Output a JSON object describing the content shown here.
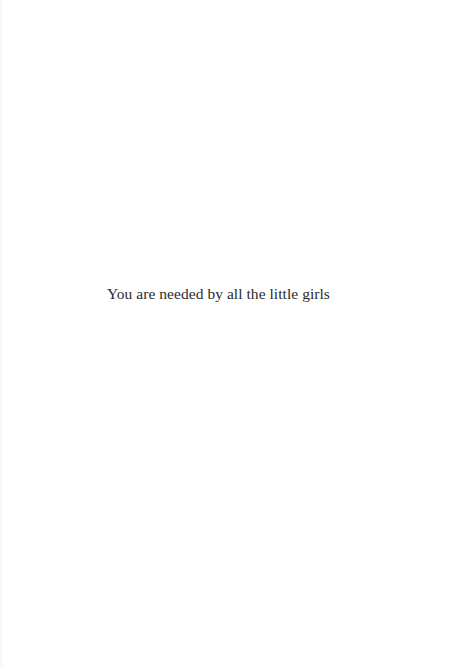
{
  "page": {
    "text": "You are needed by all the little girls",
    "colors": {
      "background": "#ffffff",
      "text": "#2b2b2b"
    }
  }
}
